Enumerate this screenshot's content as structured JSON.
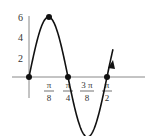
{
  "chart_data": {
    "type": "line",
    "title": "",
    "function": "y = 6 sin(4x)",
    "xlabel": "",
    "ylabel": "",
    "x_ticks": [
      {
        "num": "π",
        "den": "8",
        "value": 0.3927
      },
      {
        "num": "π",
        "den": "4",
        "value": 0.7854
      },
      {
        "num": "3 π",
        "den": "8",
        "value": 1.1781
      },
      {
        "num": "π",
        "den": "2",
        "value": 1.5708
      }
    ],
    "y_ticks": [
      "2",
      "4",
      "6"
    ],
    "xlim": [
      -0.1,
      2.2
    ],
    "ylim": [
      -6,
      7
    ],
    "grid": false,
    "series": [
      {
        "name": "curve",
        "x": [
          0,
          0.3927,
          0.7854,
          1.1781,
          1.5708
        ],
        "y": [
          0,
          6,
          0,
          -6,
          0
        ]
      }
    ],
    "marked_points": [
      {
        "x": 0,
        "y": 0
      },
      {
        "x": 0.3927,
        "y": 6
      },
      {
        "x": 0.7854,
        "y": 0
      },
      {
        "x": 1.5708,
        "y": 0
      }
    ],
    "annotations": [
      "arrow at end of curve continuing upward after π/2"
    ]
  }
}
